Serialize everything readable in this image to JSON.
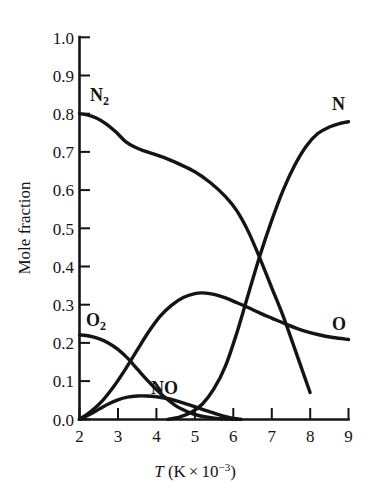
{
  "chart_data": {
    "type": "line",
    "title": "",
    "xlabel_parts": {
      "symbol": "T",
      "unit_open": " (K",
      "times": "×",
      "base": "10",
      "exponent": "−3",
      "unit_close": ")"
    },
    "xlabel": "T (K × 10−3)",
    "ylabel": "Mole fraction",
    "xlim": [
      2,
      9
    ],
    "ylim": [
      0.0,
      1.0
    ],
    "grid": false,
    "legend_position": "inline-annotations",
    "xticks": [
      "2",
      "3",
      "4",
      "5",
      "6",
      "7",
      "8",
      "9"
    ],
    "xtick_values": [
      2,
      3,
      4,
      5,
      6,
      7,
      8,
      9
    ],
    "yticks": [
      "0.0",
      "0.1",
      "0.2",
      "0.3",
      "0.4",
      "0.5",
      "0.6",
      "0.7",
      "0.8",
      "0.9",
      "1.0"
    ],
    "ytick_values": [
      0.0,
      0.1,
      0.2,
      0.3,
      0.4,
      0.5,
      0.6,
      0.7,
      0.8,
      0.9,
      1.0
    ],
    "series": [
      {
        "name": "N2",
        "label": "N₂",
        "label_text": "N",
        "label_sub": "2",
        "color": "#141414",
        "x": [
          2.0,
          2.2,
          2.45,
          2.7,
          2.95,
          3.2,
          3.45,
          3.7,
          4.0,
          4.3,
          4.6,
          5.0,
          5.4,
          5.8,
          6.1,
          6.4,
          6.7,
          7.0,
          7.3,
          7.6,
          8.0
        ],
        "values": [
          0.8,
          0.797,
          0.788,
          0.773,
          0.752,
          0.727,
          0.712,
          0.702,
          0.692,
          0.681,
          0.668,
          0.648,
          0.62,
          0.583,
          0.545,
          0.49,
          0.42,
          0.345,
          0.27,
          0.185,
          0.07
        ]
      },
      {
        "name": "O2",
        "label": "O₂",
        "label_text": "O",
        "label_sub": "2",
        "color": "#141414",
        "x": [
          2.0,
          2.25,
          2.5,
          2.75,
          3.0,
          3.25,
          3.5,
          3.75,
          4.0,
          4.25,
          4.5,
          4.7,
          4.9,
          5.1,
          5.3,
          5.5,
          5.8,
          6.1
        ],
        "values": [
          0.221,
          0.218,
          0.211,
          0.2,
          0.183,
          0.16,
          0.132,
          0.104,
          0.078,
          0.055,
          0.036,
          0.025,
          0.016,
          0.01,
          0.006,
          0.003,
          0.001,
          0.0
        ]
      },
      {
        "name": "NO",
        "label": "NO",
        "color": "#141414",
        "x": [
          2.0,
          2.25,
          2.5,
          2.75,
          3.0,
          3.25,
          3.5,
          3.75,
          4.0,
          4.25,
          4.5,
          4.75,
          5.0,
          5.25,
          5.5,
          5.75,
          6.0,
          6.2
        ],
        "values": [
          0.0,
          0.012,
          0.026,
          0.04,
          0.051,
          0.058,
          0.061,
          0.061,
          0.059,
          0.055,
          0.049,
          0.041,
          0.033,
          0.024,
          0.016,
          0.008,
          0.002,
          0.0
        ]
      },
      {
        "name": "O",
        "label": "O",
        "color": "#141414",
        "x": [
          2.0,
          2.3,
          2.6,
          2.9,
          3.2,
          3.5,
          3.8,
          4.1,
          4.4,
          4.7,
          5.0,
          5.2,
          5.5,
          5.8,
          6.1,
          6.4,
          6.7,
          7.0,
          7.4,
          7.8,
          8.2,
          8.6,
          9.0
        ],
        "values": [
          0.0,
          0.021,
          0.049,
          0.087,
          0.132,
          0.181,
          0.229,
          0.27,
          0.299,
          0.319,
          0.329,
          0.331,
          0.327,
          0.318,
          0.305,
          0.292,
          0.278,
          0.265,
          0.248,
          0.233,
          0.222,
          0.214,
          0.209
        ]
      },
      {
        "name": "N",
        "label": "N",
        "color": "#141414",
        "x": [
          4.3,
          4.6,
          4.9,
          5.2,
          5.5,
          5.8,
          6.1,
          6.4,
          6.7,
          7.0,
          7.3,
          7.6,
          7.9,
          8.2,
          8.5,
          8.8,
          9.0
        ],
        "values": [
          0.0,
          0.006,
          0.018,
          0.04,
          0.08,
          0.14,
          0.228,
          0.33,
          0.43,
          0.52,
          0.6,
          0.665,
          0.715,
          0.748,
          0.765,
          0.775,
          0.779
        ]
      }
    ],
    "annotations": [
      {
        "text": "N₂",
        "series": "N2",
        "x_px": 90,
        "y_px": 101
      },
      {
        "text": "N",
        "series": "N",
        "x_px": 332,
        "y_px": 110
      },
      {
        "text": "O₂",
        "series": "O2",
        "x_px": 86,
        "y_px": 326
      },
      {
        "text": "O",
        "series": "O",
        "x_px": 337,
        "y_px": 328
      },
      {
        "text": "NO",
        "series": "NO",
        "x_px": 155,
        "y_px": 393
      }
    ]
  }
}
